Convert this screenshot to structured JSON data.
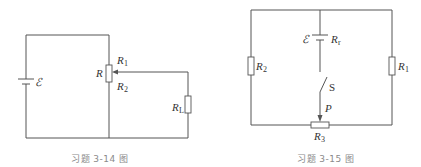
{
  "figures": [
    {
      "caption": "习题 3-14 图",
      "labels": {
        "emf": "ℰ",
        "R": "R",
        "R1": "R",
        "R1_sub": "1",
        "R2": "R",
        "R2_sub": "2",
        "RL": "R",
        "RL_sub": "L"
      }
    },
    {
      "caption": "习题 3-15 图",
      "labels": {
        "emf": "ℰ",
        "Rr": "R",
        "Rr_sub": "r",
        "R1": "R",
        "R1_sub": "1",
        "R2": "R",
        "R2_sub": "2",
        "R3": "R",
        "R3_sub": "3",
        "S": "S",
        "P": "P"
      }
    }
  ],
  "colors": {
    "wire": "#555555",
    "caption": "#8a8a8a"
  }
}
